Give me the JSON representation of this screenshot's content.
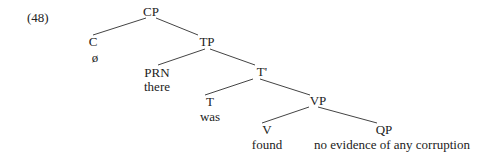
{
  "example_number": "(48)",
  "tree": {
    "nodes": {
      "CP": {
        "label": "CP"
      },
      "C": {
        "label": "C",
        "word": "ø"
      },
      "TP": {
        "label": "TP"
      },
      "PRN": {
        "label": "PRN",
        "word": "there"
      },
      "Tbar": {
        "label": "T'"
      },
      "T": {
        "label": "T",
        "word": "was"
      },
      "VP": {
        "label": "VP"
      },
      "V": {
        "label": "V",
        "word": "found"
      },
      "QP": {
        "label": "QP",
        "word": "no evidence of any corruption"
      }
    },
    "edges": [
      [
        "CP",
        "C"
      ],
      [
        "CP",
        "TP"
      ],
      [
        "TP",
        "PRN"
      ],
      [
        "TP",
        "Tbar"
      ],
      [
        "Tbar",
        "T"
      ],
      [
        "Tbar",
        "VP"
      ],
      [
        "VP",
        "V"
      ],
      [
        "VP",
        "QP"
      ]
    ]
  }
}
